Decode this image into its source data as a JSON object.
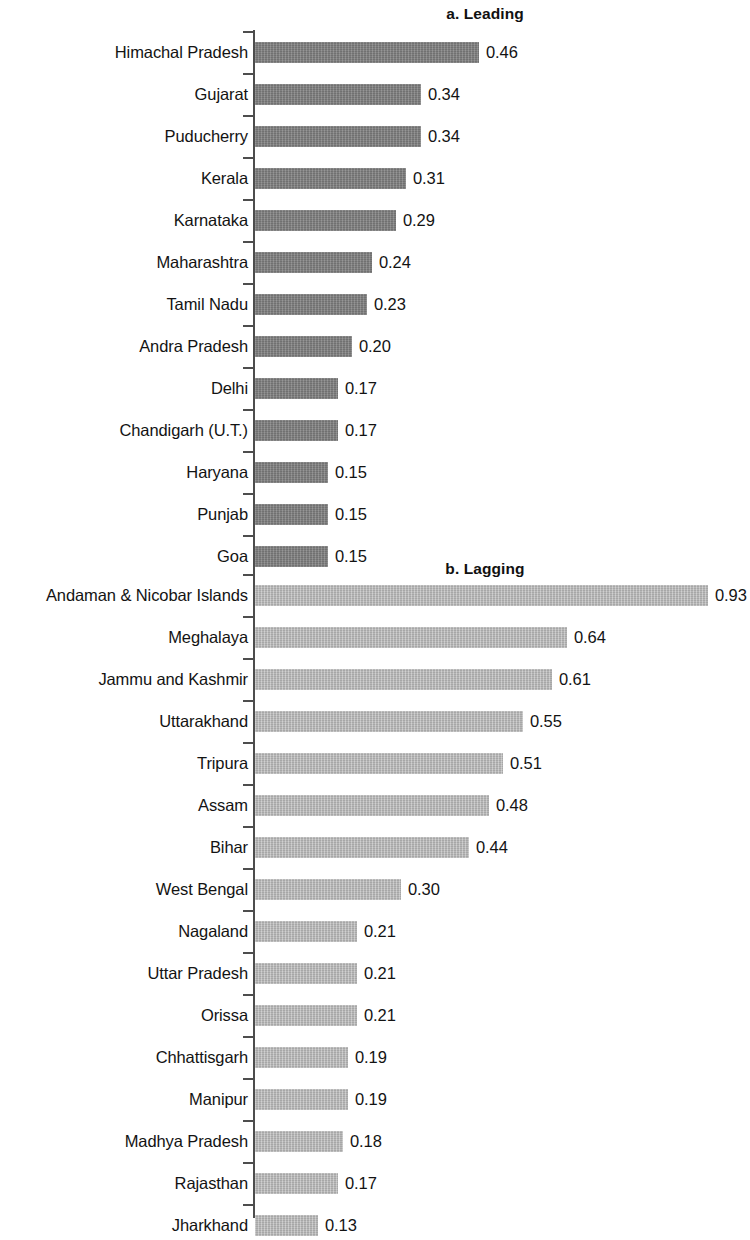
{
  "figure": {
    "colors": {
      "leading_bar": "#808080",
      "lagging_bar": "#b8b8b8",
      "axis": "#4d4d4d",
      "text": "#131313",
      "background": "#ffffff"
    }
  },
  "chart_data": [
    {
      "type": "bar",
      "orientation": "horizontal",
      "title": "a. Leading",
      "xlabel": "",
      "ylabel": "",
      "xlim": [
        0,
        0.95
      ],
      "grid": false,
      "legend": "none",
      "value_labels": true,
      "bar_color": "#808080",
      "categories": [
        "Himachal Pradesh",
        "Gujarat",
        "Puducherry",
        "Kerala",
        "Karnataka",
        "Maharashtra",
        "Tamil Nadu",
        "Andra Pradesh",
        "Delhi",
        "Chandigarh (U.T.)",
        "Haryana",
        "Punjab",
        "Goa"
      ],
      "values": [
        0.46,
        0.34,
        0.34,
        0.31,
        0.29,
        0.24,
        0.23,
        0.2,
        0.17,
        0.17,
        0.15,
        0.15,
        0.15
      ],
      "value_text": [
        "0.46",
        "0.34",
        "0.34",
        "0.31",
        "0.29",
        "0.24",
        "0.23",
        "0.20",
        "0.17",
        "0.17",
        "0.15",
        "0.15",
        "0.15"
      ]
    },
    {
      "type": "bar",
      "orientation": "horizontal",
      "title": "b. Lagging",
      "xlabel": "",
      "ylabel": "",
      "xlim": [
        0,
        0.95
      ],
      "grid": false,
      "legend": "none",
      "value_labels": true,
      "bar_color": "#b8b8b8",
      "categories": [
        "Andaman & Nicobar Islands",
        "Meghalaya",
        "Jammu and Kashmir",
        "Uttarakhand",
        "Tripura",
        "Assam",
        "Bihar",
        "West Bengal",
        "Nagaland",
        "Uttar Pradesh",
        "Orissa",
        "Chhattisgarh",
        "Manipur",
        "Madhya Pradesh",
        "Rajasthan",
        "Jharkhand"
      ],
      "values": [
        0.93,
        0.64,
        0.61,
        0.55,
        0.51,
        0.48,
        0.44,
        0.3,
        0.21,
        0.21,
        0.21,
        0.19,
        0.19,
        0.18,
        0.17,
        0.13
      ],
      "value_text": [
        "0.93",
        "0.64",
        "0.61",
        "0.55",
        "0.51",
        "0.48",
        "0.44",
        "0.30",
        "0.21",
        "0.21",
        "0.21",
        "0.19",
        "0.19",
        "0.18",
        "0.17",
        "0.13"
      ]
    }
  ]
}
